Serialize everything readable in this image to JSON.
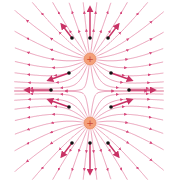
{
  "colors": {
    "field_line": "#d6457a",
    "field_line_light": "#e58aa8",
    "vector_arrow": "#c93265",
    "charge_fill": "#f4a07a",
    "charge_glow": "#fbd5c4",
    "charge_stroke": "#e07a52",
    "charge_sign": "#c9432f",
    "point": "#111111"
  },
  "charges": [
    {
      "id": "top",
      "sign": "+",
      "x": 90,
      "y": 59
    },
    {
      "id": "bottom",
      "sign": "+",
      "x": 90,
      "y": 123
    }
  ],
  "field_points": [
    {
      "x": 72,
      "y": 38,
      "dx": -10,
      "dy": -13
    },
    {
      "x": 90,
      "y": 38,
      "dx": 0,
      "dy": -30
    },
    {
      "x": 108,
      "y": 38,
      "dx": 10,
      "dy": -13
    },
    {
      "x": 69,
      "y": 73,
      "dx": -20,
      "dy": 7
    },
    {
      "x": 111,
      "y": 73,
      "dx": 20,
      "dy": 7
    },
    {
      "x": 51,
      "y": 90,
      "dx": -25,
      "dy": 0
    },
    {
      "x": 129,
      "y": 90,
      "dx": 25,
      "dy": 0
    },
    {
      "x": 69,
      "y": 107,
      "dx": -20,
      "dy": -7
    },
    {
      "x": 111,
      "y": 107,
      "dx": 20,
      "dy": -7
    },
    {
      "x": 72,
      "y": 143,
      "dx": -10,
      "dy": 13
    },
    {
      "x": 90,
      "y": 143,
      "dx": 0,
      "dy": 30
    },
    {
      "x": 108,
      "y": 143,
      "dx": 10,
      "dy": 13
    }
  ],
  "field_line_count_per_charge": 24
}
